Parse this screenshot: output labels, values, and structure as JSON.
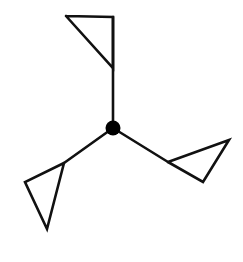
{
  "figure": {
    "background_color": "#ffffff",
    "stroke_color": "#111111",
    "hub_color": "#000000",
    "canvas": {
      "width": 243,
      "height": 262
    },
    "hub": {
      "label": "center-node",
      "cx": 113,
      "cy": 128,
      "r": 7.5
    },
    "arms": [
      {
        "name": "top-arm",
        "spoke_label": "spoke-top",
        "spoke": {
          "x1": 113,
          "y1": 128,
          "x2": 113,
          "y2": 17
        },
        "stroke_width": 2.6,
        "triangle_label": "triangle-top",
        "triangle_points": "66,16 113,17 113,68",
        "triangle_stroke_width": 2.6
      },
      {
        "name": "lower-left-arm",
        "spoke_label": "spoke-lower-left",
        "spoke": {
          "x1": 113,
          "y1": 128,
          "x2": 64,
          "y2": 163
        },
        "stroke_width": 2.6,
        "triangle_label": "triangle-lower-left",
        "triangle_points": "64,163 25,182 47,229",
        "triangle_stroke_width": 2.6
      },
      {
        "name": "right-arm",
        "spoke_label": "spoke-right",
        "spoke": {
          "x1": 113,
          "y1": 128,
          "x2": 168,
          "y2": 162
        },
        "stroke_width": 2.6,
        "triangle_label": "triangle-right",
        "triangle_points": "168,162 229,140 203,182",
        "triangle_stroke_width": 2.6
      }
    ]
  }
}
